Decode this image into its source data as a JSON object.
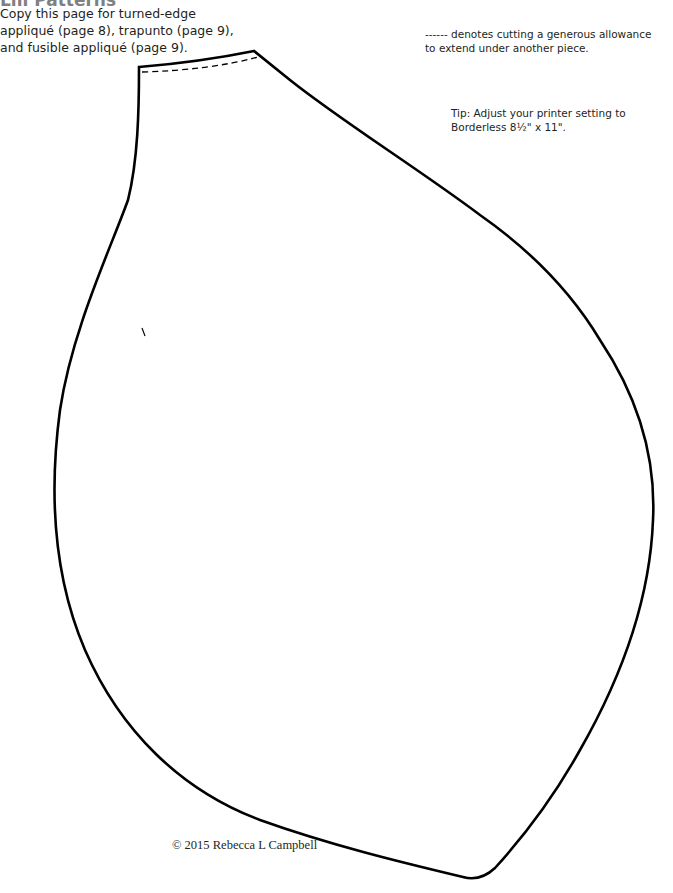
{
  "header": {
    "title": "Lili Patterns"
  },
  "intro": {
    "text": "Copy this page for turned-edge appliqué (page 8), trapunto (page 9), and fusible appliqué (page 9)."
  },
  "legend": {
    "text": "------ denotes cutting a generous allowance to extend under another piece."
  },
  "tip": {
    "line1": "Tip: Adjust your printer setting to",
    "line2": "Borderless 8½\" x 11\"."
  },
  "pattern": {
    "name": "petal-shape",
    "stroke_color": "#000000",
    "dashed_allowance": true,
    "placement_mark": "\\"
  },
  "footer": {
    "copyright": "© 2015 Rebecca L Campbell"
  }
}
